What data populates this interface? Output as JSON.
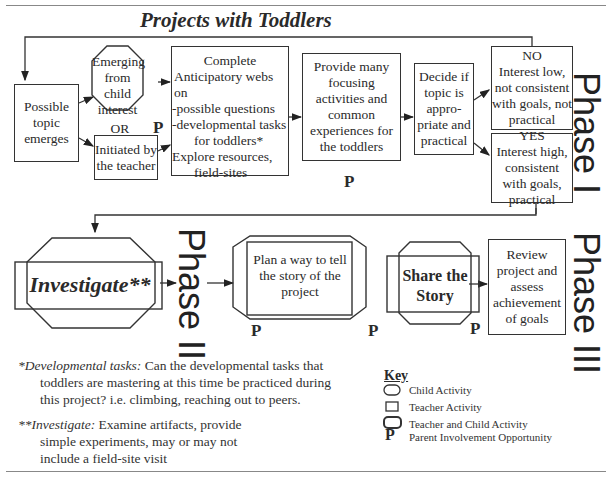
{
  "title": "Projects with Toddlers",
  "phases": {
    "phase1": "Phase I",
    "phase2": "Phase II",
    "phase3": "Phase III"
  },
  "nodes": {
    "possible_topic": "Possible topic emerges",
    "emerging_child": "Emerging from child interest",
    "or_label": "OR",
    "initiated_teacher": "Initiated by the teacher",
    "complete_webs": {
      "line1": "Complete",
      "line2": "Anticipatory webs on",
      "line3": "-possible questions",
      "line4": "-developmental tasks",
      "line5": "for toddlers*",
      "line6": "Explore resources,",
      "line7": "field-sites"
    },
    "provide_many": "Provide many focusing activities and common experiences for the toddlers",
    "decide_if": "Decide if topic is appro-priate and practical",
    "no_box": {
      "head": "NO",
      "body": "Interest low, not consistent with goals, not practical"
    },
    "yes_box": {
      "head": "YES",
      "body": "Interest high, consistent with goals, practical"
    },
    "investigate": "Investigate**",
    "plan_way": "Plan a way to tell the story of the project",
    "share_story": "Share the Story",
    "review": "Review project and assess achievement of goals"
  },
  "parent_marker": "P",
  "footnotes": {
    "dev_tasks_label": "*Developmental tasks:",
    "dev_tasks_text1": "Can the developmental tasks that",
    "dev_tasks_text2": "toddlers are mastering at this time be practiced during",
    "dev_tasks_text3": "this project? i.e. climbing, reaching out to peers.",
    "investigate_label": "**Investigate:",
    "investigate_text1": "Examine artifacts, provide",
    "investigate_text2": "simple experiments, may or may not",
    "investigate_text3": "include a field-site visit"
  },
  "key": {
    "title": "Key",
    "items": [
      {
        "icon": "rounded-rect-icon",
        "label": "Child Activity"
      },
      {
        "icon": "square-icon",
        "label": "Teacher Activity"
      },
      {
        "icon": "combined-shape-icon",
        "label": "Teacher and Child Activity"
      },
      {
        "icon": "P",
        "label": "Parent Involvement Opportunity"
      }
    ]
  }
}
